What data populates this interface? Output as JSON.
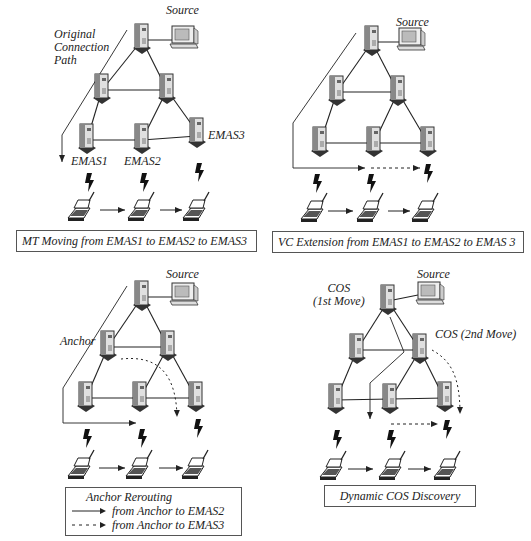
{
  "panels": [
    {
      "id": "mt-moving",
      "source_label": "Source",
      "path_label": "Original\nConnection\nPath",
      "path_lines": [
        "Original",
        "Connection",
        "Path"
      ],
      "node_labels": [
        "EMAS1",
        "EMAS2",
        "EMAS3"
      ],
      "caption": "MT Moving from EMAS1 to EMAS2 to EMAS3"
    },
    {
      "id": "vc-extension",
      "source_label": "Source",
      "caption": "VC Extension from EMAS1 to EMAS2 to EMAS 3"
    },
    {
      "id": "anchor-rerouting",
      "source_label": "Source",
      "anchor_label": "Anchor",
      "legend": {
        "title": "Anchor Rerouting",
        "items": [
          {
            "style": "solid",
            "label": "from Anchor to EMAS2"
          },
          {
            "style": "dashed",
            "label": "from Anchor to EMAS3"
          }
        ]
      }
    },
    {
      "id": "dynamic-cos",
      "source_label": "Source",
      "cos1_lines": [
        "COS",
        "(1st Move)"
      ],
      "cos2_label": "COS (2nd Move)",
      "caption": "Dynamic COS Discovery"
    }
  ],
  "colors": {
    "line": "#222222",
    "server_light": "#d8d8d8",
    "server_dark": "#555555",
    "caption_border": "#555555"
  }
}
